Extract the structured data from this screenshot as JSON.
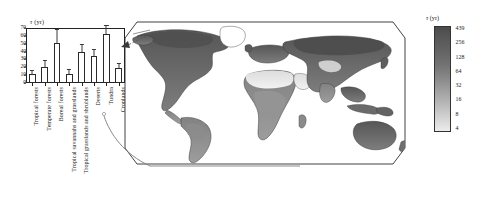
{
  "figure": {
    "kind": "two-panel scientific figure: bar chart of biome turnover times plus global map",
    "background": "#ffffff"
  },
  "chart_data": [
    {
      "type": "bar",
      "id": "biome-turnover-bars",
      "title": "",
      "ylabel": "τ (yr)",
      "ylabel_symbol": "τ",
      "ylabel_unit": "(yr)",
      "xlabel": "",
      "ylim": [
        0,
        70
      ],
      "yticks": [
        0,
        10,
        20,
        30,
        40,
        50,
        60,
        70
      ],
      "ytick_labels": [
        "0",
        "10",
        "20",
        "30",
        "40",
        "50",
        "60",
        "70"
      ],
      "grid": false,
      "legend": "none",
      "bar_facecolor": "#ffffff",
      "bar_edgecolor": "#2a2a2a",
      "errorbar_color": "#3a3a3a",
      "errorbar_direction": "upper only",
      "categories": [
        "Tropical forests",
        "Temperate forests",
        "Boreal forests",
        "Tropical savannahs and grasslands",
        "Tropical grasslands and shrublands",
        "Deserts",
        "Tundra",
        "Croplands"
      ],
      "values": [
        11,
        20,
        51,
        12,
        40,
        35,
        62,
        19
      ],
      "errors_upper": [
        4,
        8,
        17,
        5,
        9,
        7,
        10,
        5
      ]
    },
    {
      "type": "heatmap",
      "id": "global-tau-map",
      "title": "",
      "projection": "Robinson-like global projection with rounded frame",
      "colorbar": {
        "label": "τ (yr)",
        "label_symbol": "τ",
        "label_unit": "(yr)",
        "scale": "log2",
        "tick_labels": [
          "439",
          "256",
          "128",
          "64",
          "32",
          "16",
          "8",
          "4"
        ],
        "tick_values": [
          439,
          256,
          128,
          64,
          32,
          16,
          8,
          4
        ],
        "vmin": 4,
        "vmax": 439,
        "orientation": "vertical",
        "high_end": "top (dark)",
        "low_end": "bottom (light)",
        "colors_dark": "#4a4a4a",
        "colors_light": "#ececec"
      },
      "regions_described": [
        {
          "name": "Boreal Eurasia / Siberia",
          "shade": "dark",
          "tau_band": "128-439"
        },
        {
          "name": "Northern North America / Canada",
          "shade": "dark",
          "tau_band": "128-439"
        },
        {
          "name": "Amazon basin",
          "shade": "medium",
          "tau_band": "16-64"
        },
        {
          "name": "Sahara desert",
          "shade": "very light",
          "tau_band": "4-8"
        },
        {
          "name": "Arabian peninsula",
          "shade": "very light",
          "tau_band": "4-8"
        },
        {
          "name": "Central Africa",
          "shade": "medium",
          "tau_band": "16-64"
        },
        {
          "name": "Australia interior",
          "shade": "medium-dark",
          "tau_band": "32-128"
        },
        {
          "name": "Southeast Asia",
          "shade": "dark",
          "tau_band": "64-256"
        },
        {
          "name": "Greenland",
          "shade": "blank / no data",
          "tau_band": "none"
        }
      ]
    }
  ],
  "barchart": {
    "ylabel_symbol": "τ",
    "ylabel_unit": "(yr)",
    "yticks": [
      "70",
      "60",
      "50",
      "40",
      "30",
      "20",
      "10",
      "0"
    ],
    "categories": [
      "Tropical forests",
      "Temperate forests",
      "Boreal forests",
      "Tropical savannahs and grasslands",
      "Tropical grasslands and shrublands",
      "Deserts",
      "Tundra",
      "Croplands"
    ]
  },
  "colorbar": {
    "symbol": "τ",
    "unit": "(yr)",
    "ticks": [
      "439",
      "256",
      "128",
      "64",
      "32",
      "16",
      "8",
      "4"
    ]
  }
}
